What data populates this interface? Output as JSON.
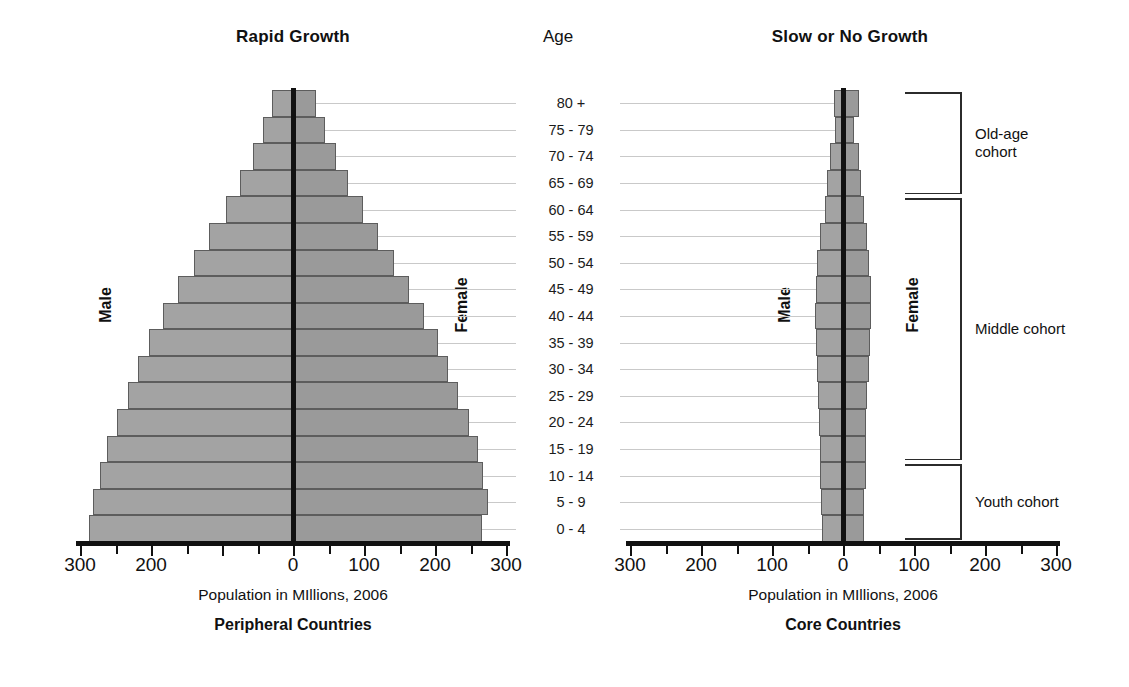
{
  "chart_data": {
    "type": "bar",
    "subtype": "population-pyramid",
    "xlabel": "Population in MIllions, 2006",
    "ylabel": "Age",
    "xlim": [
      -300,
      300
    ],
    "xticks": [
      300,
      200,
      100,
      0,
      100,
      200,
      300
    ],
    "xtick_step_minor": 50,
    "grid": false,
    "legend": [
      "Male",
      "Female"
    ],
    "categories": [
      "80 +",
      "75 - 79",
      "70 - 74",
      "65 - 69",
      "60 - 64",
      "55 - 59",
      "50 - 54",
      "45 - 49",
      "40 - 44",
      "35 - 39",
      "30 - 34",
      "25 - 29",
      "20 - 24",
      "15 - 19",
      "10 - 14",
      "5 - 9",
      "0 - 4"
    ],
    "panels": [
      {
        "name": "peripheral",
        "title": "Rapid Growth",
        "footer": "Peripheral Countries",
        "xlabel": "Population in MIllions, 2006",
        "series": [
          {
            "name": "Male",
            "values": [
              30,
              42,
              57,
              75,
              95,
              118,
              140,
              162,
              183,
              203,
              218,
              232,
              248,
              262,
              272,
              281,
              288
            ]
          },
          {
            "name": "Female",
            "values": [
              33,
              45,
              60,
              78,
              98,
              120,
              142,
              164,
              185,
              204,
              219,
              233,
              248,
              260,
              268,
              274,
              266
            ]
          }
        ]
      },
      {
        "name": "core",
        "title": "Slow or No Growth",
        "footer": "Core Countries",
        "xlabel": "Population in MIllions, 2006",
        "series": [
          {
            "name": "Male",
            "values": [
              13,
              11,
              19,
              23,
              26,
              32,
              36,
              38,
              40,
              38,
              37,
              35,
              34,
              33,
              33,
              31,
              30
            ]
          },
          {
            "name": "Female",
            "values": [
              22,
              15,
              22,
              26,
              29,
              34,
              37,
              39,
              40,
              38,
              36,
              34,
              33,
              32,
              32,
              30,
              29
            ]
          }
        ]
      }
    ],
    "cohorts": [
      {
        "label": "Old-age\ncohort",
        "from_category": "80 +",
        "to_category": "65 - 69"
      },
      {
        "label": "Middle cohort",
        "from_category": "60 - 64",
        "to_category": "15 - 19"
      },
      {
        "label": "Youth cohort",
        "from_category": "10 - 14",
        "to_category": "0 - 4"
      }
    ]
  },
  "header": {
    "left_title": "Rapid Growth",
    "age_title": "Age",
    "right_title": "Slow or No Growth"
  },
  "left_panel": {
    "male_label": "Male",
    "female_label": "Female",
    "axis_caption": "Population in MIllions, 2006",
    "footer": "Peripheral Countries",
    "ticks": [
      "300",
      "200",
      "0",
      "100",
      "200",
      "300"
    ]
  },
  "right_panel": {
    "male_label": "Male",
    "female_label": "Female",
    "axis_caption": "Population in MIllions, 2006",
    "footer": "Core Countries",
    "ticks": [
      "300",
      "200",
      "100",
      "0",
      "100",
      "200",
      "300"
    ]
  },
  "age_labels": [
    "80 +",
    "75 - 79",
    "70 - 74",
    "65 - 69",
    "60 - 64",
    "55 - 59",
    "50 - 54",
    "45 - 49",
    "40 - 44",
    "35 - 39",
    "30 - 34",
    "25 - 29",
    "20 - 24",
    "15 - 19",
    "10 - 14",
    "5 - 9",
    "0 - 4"
  ],
  "cohorts": {
    "old_age": "Old-age\ncohort",
    "middle": "Middle cohort",
    "youth": "Youth cohort"
  },
  "colors": {
    "male_bar": "#a3a3a3",
    "female_bar": "#9a9a9a",
    "bar_outline": "#5d5d5d",
    "axis": "#111111",
    "leader_line": "#c9c9c9",
    "background": "#ffffff"
  }
}
